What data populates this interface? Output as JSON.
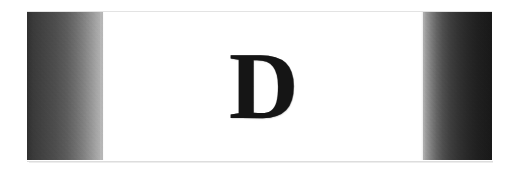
{
  "figure": {
    "kind": "scanned-dropcap-plate",
    "canvas_width": 519,
    "canvas_height": 174,
    "page_background": "#ffffff"
  },
  "plate": {
    "background": "#ffffff",
    "border_color": "#e3e3e3",
    "shadow_color": "#dddddd"
  },
  "bands": {
    "left": {
      "name": "left-dark-band",
      "dark_color": "#2f2f2f",
      "light_color": "#b6b6b6",
      "direction": "dark-to-light"
    },
    "right": {
      "name": "right-dark-band",
      "dark_color": "#181818",
      "light_color": "#b0b0b0",
      "direction": "light-to-dark"
    }
  },
  "letter": {
    "character": "D",
    "color": "#151515",
    "style": "serif-capital-dropcap"
  }
}
